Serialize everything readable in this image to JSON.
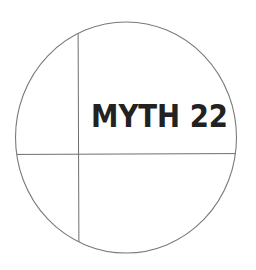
{
  "diagram": {
    "label": "MYTH 22",
    "colors": {
      "background": "#ffffff",
      "stroke": "#7a7a7a",
      "text": "#222222"
    },
    "circle": {
      "cx": 126,
      "cy": 137.5,
      "rx": 110.5,
      "ry": 115.5
    },
    "vertical_divider_x": 78,
    "horizontal_divider_y": 154
  }
}
